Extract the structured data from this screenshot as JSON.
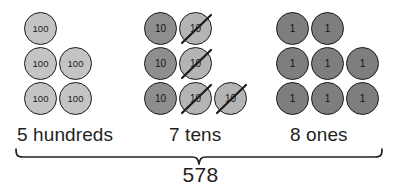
{
  "diagram": {
    "title_number": "578",
    "groups": [
      {
        "key": "hundreds",
        "label": "5 hundreds",
        "disc_value": "100",
        "count": 5,
        "crossed_count": 0,
        "fill_color": "#c4c4c4",
        "rows": [
          {
            "discs": [
              {
                "value": "100",
                "crossed": false
              }
            ],
            "lead_gap": 0
          },
          {
            "discs": [
              {
                "value": "100",
                "crossed": false
              },
              {
                "value": "100",
                "crossed": false
              }
            ],
            "lead_gap": 0
          },
          {
            "discs": [
              {
                "value": "100",
                "crossed": false
              },
              {
                "value": "100",
                "crossed": false
              }
            ],
            "lead_gap": 0
          }
        ]
      },
      {
        "key": "tens",
        "label": "7 tens",
        "disc_value": "10",
        "count": 7,
        "crossed_count": 4,
        "fill_color": "#8e8e8e",
        "crossed_fill_color": "#b4b4b4",
        "rows": [
          {
            "discs": [
              {
                "value": "10",
                "crossed": false
              },
              {
                "value": "10",
                "crossed": true
              }
            ],
            "lead_gap": 0
          },
          {
            "discs": [
              {
                "value": "10",
                "crossed": false
              },
              {
                "value": "10",
                "crossed": true
              }
            ],
            "lead_gap": 0
          },
          {
            "discs": [
              {
                "value": "10",
                "crossed": false
              },
              {
                "value": "10",
                "crossed": true
              },
              {
                "value": "10",
                "crossed": true
              }
            ],
            "lead_gap": 0
          }
        ]
      },
      {
        "key": "ones",
        "label": "8 ones",
        "disc_value": "1",
        "count": 8,
        "crossed_count": 0,
        "fill_color": "#7e7e7e",
        "rows": [
          {
            "discs": [
              {
                "value": "1",
                "crossed": false
              },
              {
                "value": "1",
                "crossed": false
              }
            ],
            "lead_gap": 0
          },
          {
            "discs": [
              {
                "value": "1",
                "crossed": false
              },
              {
                "value": "1",
                "crossed": false
              },
              {
                "value": "1",
                "crossed": false
              }
            ],
            "lead_gap": 0
          },
          {
            "discs": [
              {
                "value": "1",
                "crossed": false
              },
              {
                "value": "1",
                "crossed": false
              },
              {
                "value": "1",
                "crossed": false
              }
            ],
            "lead_gap": 0
          }
        ]
      }
    ],
    "colors": {
      "ink": "#231f20",
      "outline": "#1a1a1a",
      "background": "#ffffff"
    }
  }
}
